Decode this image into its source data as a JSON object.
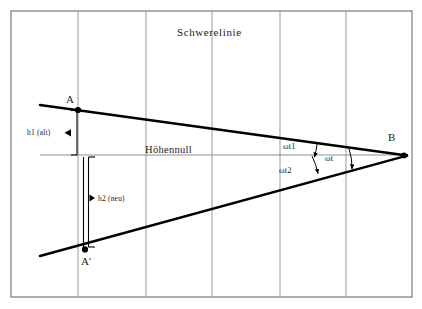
{
  "figure": {
    "title": "Schwerelinie",
    "axis_label": "Höhennull",
    "background_color": "#ffffff",
    "line_color": "#000000",
    "grid_color": "#8a8a8a",
    "frame_color": "#6e6e6e"
  },
  "points": [
    {
      "id": "A",
      "label": "A",
      "x": 78,
      "y": 110
    },
    {
      "id": "Ap",
      "label": "A'",
      "x": 85,
      "y": 248
    },
    {
      "id": "B",
      "label": "B",
      "x": 404,
      "y": 155
    }
  ],
  "measurements": [
    {
      "id": "h1",
      "label": "h1 (alt)",
      "description": "height of A above Höhennull"
    },
    {
      "id": "h2",
      "label": "h2 (neu)",
      "description": "height of A' below Höhennull"
    }
  ],
  "angles": [
    {
      "id": "wt1",
      "label": "ωt1",
      "description": "angle between upper line and Höhennull at B"
    },
    {
      "id": "wt2",
      "label": "ωt2",
      "description": "angle between Höhennull and lower line at B"
    },
    {
      "id": "wt",
      "label": "ωt",
      "description": "total angle between upper and lower line at B"
    }
  ],
  "grid": {
    "frame": {
      "left": 11,
      "top": 11,
      "right": 412,
      "bottom": 297
    },
    "vertical_lines_x": [
      78,
      146,
      212,
      280,
      346
    ]
  }
}
